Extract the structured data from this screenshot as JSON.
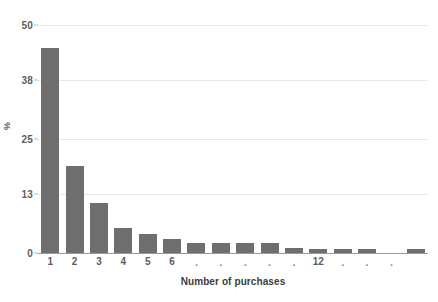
{
  "chart_data": {
    "type": "bar",
    "title": "",
    "subtitle": "",
    "xlabel": "Number of purchases",
    "ylabel": "%",
    "ylim": [
      0,
      50
    ],
    "yticks": [
      0,
      13,
      25,
      38,
      50
    ],
    "ytick_labels": [
      "0",
      "13",
      "25",
      "38",
      "50"
    ],
    "grid": true,
    "legend": "none",
    "bar_color": "#6e6e6e",
    "gridline_color": "#e8e8e8",
    "axis_color": "#9a9a9a",
    "tick_text_color": "#5d5d5d",
    "categories": [
      "1",
      "2",
      "3",
      "4",
      "5",
      "6",
      ".",
      ".",
      ".",
      ".",
      ".",
      "12",
      ".",
      ".",
      ".",
      ""
    ],
    "xtick_labels": [
      "1",
      "2",
      "3",
      "4",
      "5",
      "6",
      ".",
      ".",
      ".",
      ".",
      ".",
      "12",
      ".",
      ".",
      ".",
      ""
    ],
    "values": [
      45,
      19,
      11,
      5.5,
      4.2,
      3,
      2.2,
      2.2,
      2.2,
      2.1,
      1,
      0.9,
      0.9,
      0.9,
      0,
      0.9
    ],
    "n_bars": 16
  },
  "axes": {
    "y_title": "%",
    "x_title": "Number of purchases"
  }
}
